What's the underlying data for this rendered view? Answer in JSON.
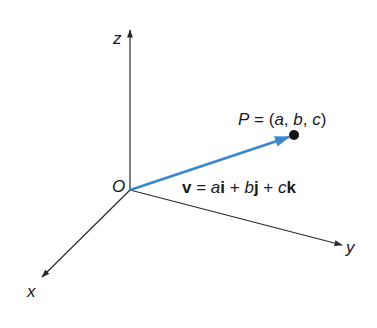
{
  "diagram": {
    "axes": {
      "z": {
        "label": "z"
      },
      "x": {
        "label": "x"
      },
      "y": {
        "label": "y"
      }
    },
    "origin": {
      "label": "O"
    },
    "point": {
      "label_P": "P",
      "label_eq": " = (",
      "a": "a",
      "sep1": ", ",
      "b": "b",
      "sep2": ", ",
      "c": "c",
      "close": ")"
    },
    "vector": {
      "v": "v",
      "eq": " = ",
      "a": "a",
      "i": "i",
      "plus1": " + ",
      "b": "b",
      "j": "j",
      "plus2": " + ",
      "c": "c",
      "k": "k"
    },
    "colors": {
      "axis": "#2a2a2a",
      "vector": "#3b87d0",
      "point": "#111111",
      "text": "#1a1a1a"
    }
  }
}
